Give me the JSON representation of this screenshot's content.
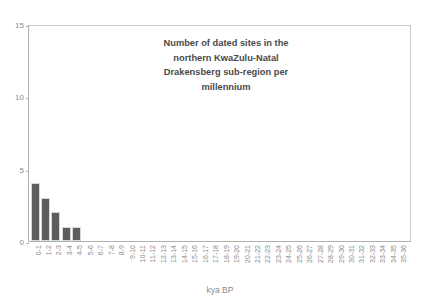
{
  "chart_data": {
    "type": "bar",
    "title": "Number of dated sites in the northern KwaZulu-Natal Drakensberg sub-region per millennium",
    "title_lines": [
      "Number of dated sites in the",
      "northern KwaZulu-Natal",
      "Drakensberg sub-region per",
      "millennium"
    ],
    "xlabel": "kya BP",
    "ylabel": "",
    "ylim": [
      0,
      15
    ],
    "yticks": [
      0,
      5,
      10,
      15
    ],
    "ytick_labels": [
      "0",
      "5",
      "10",
      "15"
    ],
    "grid": false,
    "legend": false,
    "bar_color": "#5d5d5d",
    "bar_edge_color": "#d8d8d8",
    "axis_color": "#b0b0b0",
    "text_color": "#8a8a8a",
    "categories": [
      "0-1",
      "1-2",
      "2-3",
      "3-4",
      "4-5",
      "5-6",
      "6-7",
      "7-8",
      "8-9",
      "9-10",
      "10-11",
      "11-12",
      "12-13",
      "13-14",
      "14-15",
      "15-16",
      "16-17",
      "17-18",
      "18-19",
      "19-20",
      "20-21",
      "21-22",
      "22-23",
      "23-24",
      "24-25",
      "25-26",
      "26-27",
      "27-28",
      "28-29",
      "29-30",
      "30-31",
      "31-32",
      "32-33",
      "33-34",
      "34-35",
      "35-36"
    ],
    "values": [
      4,
      3,
      2,
      1,
      1,
      0,
      0,
      0,
      0,
      0,
      0,
      0,
      0,
      0,
      0,
      0,
      0,
      0,
      0,
      0,
      0,
      0,
      0,
      0,
      0,
      0,
      0,
      0,
      0,
      0,
      0,
      0,
      0,
      0,
      0,
      0
    ]
  }
}
